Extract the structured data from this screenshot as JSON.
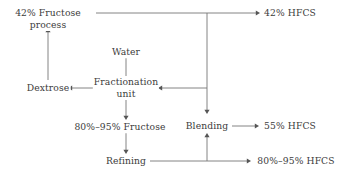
{
  "diagram": {
    "type": "flowchart",
    "canvas": {
      "width": 342,
      "height": 177
    },
    "text_color": "#3b3b3b",
    "line_color": "#777777",
    "arrow_color": "#555555",
    "background": "#ffffff",
    "nodes": [
      {
        "id": "fructose_process_42",
        "label_line1": "42% Fructose",
        "label_line2": "process",
        "x": 48,
        "y": 19,
        "lines": 2
      },
      {
        "id": "hfcs_42",
        "label_line1": "42% HFCS",
        "label_line2": "",
        "x": 290,
        "y": 13,
        "lines": 1
      },
      {
        "id": "water",
        "label_line1": "Water",
        "label_line2": "",
        "x": 126,
        "y": 52,
        "lines": 1
      },
      {
        "id": "dextrose",
        "label_line1": "Dextrose",
        "label_line2": "",
        "x": 48,
        "y": 88,
        "lines": 1
      },
      {
        "id": "fractionation_unit",
        "label_line1": "Fractionation",
        "label_line2": "unit",
        "x": 126,
        "y": 88,
        "lines": 2
      },
      {
        "id": "fructose_80_95",
        "label_line1": "80%–95% Fructose",
        "label_line2": "",
        "x": 120,
        "y": 127,
        "lines": 1
      },
      {
        "id": "blending",
        "label_line1": "Blending",
        "label_line2": "",
        "x": 207,
        "y": 126,
        "lines": 1
      },
      {
        "id": "hfcs_55",
        "label_line1": "55% HFCS",
        "label_line2": "",
        "x": 290,
        "y": 126,
        "lines": 1
      },
      {
        "id": "refining",
        "label_line1": "Refining",
        "label_line2": "",
        "x": 126,
        "y": 161,
        "lines": 1
      },
      {
        "id": "hfcs_80_95",
        "label_line1": "80%–95% HFCS",
        "label_line2": "",
        "x": 296,
        "y": 161,
        "lines": 1
      }
    ],
    "edges": [
      {
        "id": "edge-fructose42-to-hfcs42",
        "from": "fructose_process_42",
        "to": "hfcs_42",
        "points": "96,13 258,13",
        "arrow": {
          "x": 260,
          "y": 13,
          "dir": "right"
        }
      },
      {
        "id": "edge-fructose42-trunk-down",
        "from": "fructose_process_42",
        "to": "blending",
        "points": "207,13 207,111",
        "arrow": {
          "x": 207,
          "y": 114,
          "dir": "down"
        }
      },
      {
        "id": "edge-trunk-to-fractionation",
        "from": "fructose_process_42",
        "to": "fractionation_unit",
        "points": "207,88 161,88",
        "arrow": {
          "x": 158,
          "y": 88,
          "dir": "left"
        }
      },
      {
        "id": "edge-dextrose-to-fructose42",
        "from": "dextrose",
        "to": "fructose_process_42",
        "points": "48,80 48,31",
        "arrow": {
          "x": 48,
          "y": 28,
          "dir": "up"
        }
      },
      {
        "id": "edge-fractionation-to-dextrose",
        "from": "fractionation_unit",
        "to": "dextrose",
        "points": "102,88 71,88",
        "arrow": {
          "x": 68,
          "y": 88,
          "dir": "left"
        }
      },
      {
        "id": "edge-water-to-fractionation",
        "from": "water",
        "to": "fractionation_unit",
        "points": "126,58 126,79",
        "arrow": {
          "x": 126,
          "y": 82,
          "dir": "down"
        }
      },
      {
        "id": "edge-fractionation-to-fructose8095",
        "from": "fractionation_unit",
        "to": "fructose_80_95",
        "points": "126,100 126,117",
        "arrow": {
          "x": 126,
          "y": 120,
          "dir": "down"
        }
      },
      {
        "id": "edge-fructose8095-to-refining",
        "from": "fructose_80_95",
        "to": "refining",
        "points": "126,133 126,151",
        "arrow": {
          "x": 126,
          "y": 154,
          "dir": "down"
        }
      },
      {
        "id": "edge-refining-to-hfcs8095",
        "from": "refining",
        "to": "hfcs_80_95",
        "points": "150,161 248,161",
        "arrow": {
          "x": 251,
          "y": 161,
          "dir": "right"
        }
      },
      {
        "id": "edge-refining-to-blending",
        "from": "refining",
        "to": "blending",
        "points": "207,161 207,136",
        "arrow": {
          "x": 207,
          "y": 133,
          "dir": "up"
        }
      },
      {
        "id": "edge-blending-to-hfcs55",
        "from": "blending",
        "to": "hfcs_55",
        "points": "232,126 256,126",
        "arrow": {
          "x": 259,
          "y": 126,
          "dir": "right"
        }
      }
    ]
  }
}
